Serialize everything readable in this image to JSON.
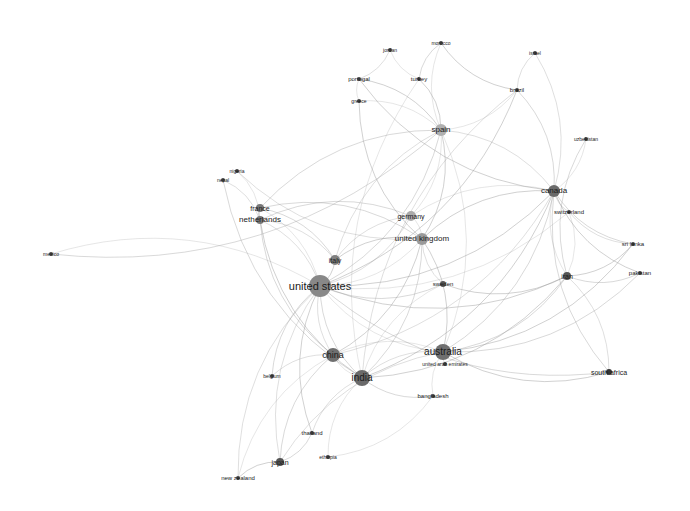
{
  "diagram": {
    "type": "network",
    "nodes": [
      {
        "id": "united states",
        "label": "united states",
        "x": 320,
        "y": 286,
        "r": 11,
        "fs": 11,
        "color": "#888888"
      },
      {
        "id": "australia",
        "label": "australia",
        "x": 443,
        "y": 352,
        "r": 8,
        "fs": 10,
        "color": "#6f6f6f"
      },
      {
        "id": "china",
        "label": "china",
        "x": 333,
        "y": 355,
        "r": 7,
        "fs": 9,
        "color": "#6f6f6f"
      },
      {
        "id": "india",
        "label": "india",
        "x": 362,
        "y": 378,
        "r": 8,
        "fs": 10,
        "color": "#6a6a6a"
      },
      {
        "id": "canada",
        "label": "canada",
        "x": 554,
        "y": 191,
        "r": 6,
        "fs": 8,
        "color": "#6a6a6a"
      },
      {
        "id": "united kingdom",
        "label": "united kingdom",
        "x": 422,
        "y": 239,
        "r": 6,
        "fs": 8,
        "color": "#9a9a9a"
      },
      {
        "id": "germany",
        "label": "germany",
        "x": 411,
        "y": 216,
        "r": 5,
        "fs": 7,
        "color": "#aaaaaa"
      },
      {
        "id": "spain",
        "label": "spain",
        "x": 441,
        "y": 130,
        "r": 6,
        "fs": 8,
        "color": "#b0b0b0"
      },
      {
        "id": "italy",
        "label": "italy",
        "x": 335,
        "y": 260,
        "r": 5,
        "fs": 7,
        "color": "#808080"
      },
      {
        "id": "france",
        "label": "france",
        "x": 260,
        "y": 208,
        "r": 4,
        "fs": 7,
        "color": "#777777"
      },
      {
        "id": "netherlands",
        "label": "netherlands",
        "x": 260,
        "y": 220,
        "r": 4,
        "fs": 8,
        "color": "#777777"
      },
      {
        "id": "sweden",
        "label": "sweden",
        "x": 443,
        "y": 284,
        "r": 3,
        "fs": 6,
        "color": "#555555"
      },
      {
        "id": "iran",
        "label": "iran",
        "x": 567,
        "y": 276,
        "r": 4,
        "fs": 7,
        "color": "#555555"
      },
      {
        "id": "switzerland",
        "label": "switzerland",
        "x": 569,
        "y": 212,
        "r": 2,
        "fs": 6,
        "color": "#444444"
      },
      {
        "id": "uzbekistan",
        "label": "uzbekistan",
        "x": 586,
        "y": 139,
        "r": 2,
        "fs": 5,
        "color": "#444444"
      },
      {
        "id": "sri lanka",
        "label": "sri lanka",
        "x": 633,
        "y": 244,
        "r": 2,
        "fs": 6,
        "color": "#444444"
      },
      {
        "id": "pakistan",
        "label": "pakistan",
        "x": 640,
        "y": 273,
        "r": 2,
        "fs": 6,
        "color": "#444444"
      },
      {
        "id": "south africa",
        "label": "south africa",
        "x": 609,
        "y": 372,
        "r": 3,
        "fs": 7,
        "color": "#333333"
      },
      {
        "id": "united arab emirates",
        "label": "united arab emirates",
        "x": 445,
        "y": 364,
        "r": 2,
        "fs": 5,
        "color": "#444444"
      },
      {
        "id": "bangladesh",
        "label": "bangladesh",
        "x": 433,
        "y": 396,
        "r": 2,
        "fs": 6,
        "color": "#444444"
      },
      {
        "id": "belgium",
        "label": "belgium",
        "x": 272,
        "y": 376,
        "r": 2,
        "fs": 5,
        "color": "#444444"
      },
      {
        "id": "thailand",
        "label": "thailand",
        "x": 312,
        "y": 433,
        "r": 2,
        "fs": 6,
        "color": "#444444"
      },
      {
        "id": "ethiopia",
        "label": "ethiopia",
        "x": 328,
        "y": 457,
        "r": 2,
        "fs": 5,
        "color": "#444444"
      },
      {
        "id": "japan",
        "label": "japan",
        "x": 280,
        "y": 462,
        "r": 4,
        "fs": 7,
        "color": "#555555"
      },
      {
        "id": "new zealand",
        "label": "new zealand",
        "x": 238,
        "y": 478,
        "r": 2,
        "fs": 6,
        "color": "#444444"
      },
      {
        "id": "mexico",
        "label": "mexico",
        "x": 51,
        "y": 254,
        "r": 2,
        "fs": 5,
        "color": "#444444"
      },
      {
        "id": "nigeria",
        "label": "nigeria",
        "x": 237,
        "y": 171,
        "r": 2,
        "fs": 5,
        "color": "#444444"
      },
      {
        "id": "nepal",
        "label": "nepal",
        "x": 223,
        "y": 180,
        "r": 2,
        "fs": 5,
        "color": "#444444"
      },
      {
        "id": "portugal",
        "label": "portugal",
        "x": 359,
        "y": 79,
        "r": 2,
        "fs": 6,
        "color": "#444444"
      },
      {
        "id": "greece",
        "label": "greece",
        "x": 359,
        "y": 101,
        "r": 2,
        "fs": 5,
        "color": "#444444"
      },
      {
        "id": "jordan",
        "label": "jordan",
        "x": 390,
        "y": 50,
        "r": 2,
        "fs": 5,
        "color": "#444444"
      },
      {
        "id": "morocco",
        "label": "morocco",
        "x": 441,
        "y": 43,
        "r": 2,
        "fs": 5,
        "color": "#444444"
      },
      {
        "id": "turkey",
        "label": "turkey",
        "x": 419,
        "y": 79,
        "r": 2,
        "fs": 6,
        "color": "#444444"
      },
      {
        "id": "israel",
        "label": "israel",
        "x": 535,
        "y": 53,
        "r": 2,
        "fs": 5,
        "color": "#444444"
      },
      {
        "id": "brazil",
        "label": "brazil",
        "x": 517,
        "y": 90,
        "r": 2,
        "fs": 6,
        "color": "#444444"
      }
    ],
    "edges": [
      [
        "united states",
        "australia"
      ],
      [
        "united states",
        "china"
      ],
      [
        "united states",
        "india"
      ],
      [
        "united states",
        "canada"
      ],
      [
        "united states",
        "united kingdom"
      ],
      [
        "united states",
        "germany"
      ],
      [
        "united states",
        "spain"
      ],
      [
        "united states",
        "italy"
      ],
      [
        "united states",
        "france"
      ],
      [
        "united states",
        "netherlands"
      ],
      [
        "united states",
        "sweden"
      ],
      [
        "united states",
        "iran"
      ],
      [
        "united states",
        "mexico"
      ],
      [
        "united states",
        "japan"
      ],
      [
        "united states",
        "south africa"
      ],
      [
        "united states",
        "brazil"
      ],
      [
        "united states",
        "switzerland"
      ],
      [
        "united states",
        "new zealand"
      ],
      [
        "united states",
        "belgium"
      ],
      [
        "united states",
        "thailand"
      ],
      [
        "australia",
        "china"
      ],
      [
        "australia",
        "india"
      ],
      [
        "australia",
        "canada"
      ],
      [
        "australia",
        "united kingdom"
      ],
      [
        "australia",
        "bangladesh"
      ],
      [
        "australia",
        "united arab emirates"
      ],
      [
        "australia",
        "iran"
      ],
      [
        "australia",
        "south africa"
      ],
      [
        "australia",
        "spain"
      ],
      [
        "australia",
        "japan"
      ],
      [
        "australia",
        "pakistan"
      ],
      [
        "australia",
        "sri lanka"
      ],
      [
        "china",
        "india"
      ],
      [
        "china",
        "canada"
      ],
      [
        "china",
        "japan"
      ],
      [
        "china",
        "united kingdom"
      ],
      [
        "china",
        "new zealand"
      ],
      [
        "china",
        "belgium"
      ],
      [
        "india",
        "bangladesh"
      ],
      [
        "india",
        "canada"
      ],
      [
        "india",
        "ethiopia"
      ],
      [
        "india",
        "thailand"
      ],
      [
        "india",
        "united kingdom"
      ],
      [
        "india",
        "iran"
      ],
      [
        "canada",
        "uzbekistan"
      ],
      [
        "canada",
        "switzerland"
      ],
      [
        "canada",
        "sri lanka"
      ],
      [
        "canada",
        "pakistan"
      ],
      [
        "canada",
        "iran"
      ],
      [
        "canada",
        "spain"
      ],
      [
        "canada",
        "brazil"
      ],
      [
        "canada",
        "united kingdom"
      ],
      [
        "canada",
        "germany"
      ],
      [
        "canada",
        "israel"
      ],
      [
        "canada",
        "south africa"
      ],
      [
        "united kingdom",
        "spain"
      ],
      [
        "united kingdom",
        "germany"
      ],
      [
        "united kingdom",
        "sweden"
      ],
      [
        "united kingdom",
        "france"
      ],
      [
        "united kingdom",
        "italy"
      ],
      [
        "germany",
        "spain"
      ],
      [
        "germany",
        "italy"
      ],
      [
        "germany",
        "netherlands"
      ],
      [
        "spain",
        "portugal"
      ],
      [
        "spain",
        "brazil"
      ],
      [
        "spain",
        "italy"
      ],
      [
        "spain",
        "france"
      ],
      [
        "spain",
        "turkey"
      ],
      [
        "spain",
        "greece"
      ],
      [
        "italy",
        "netherlands"
      ],
      [
        "italy",
        "france"
      ],
      [
        "france",
        "netherlands"
      ],
      [
        "netherlands",
        "nigeria"
      ],
      [
        "netherlands",
        "nepal"
      ],
      [
        "netherlands",
        "china"
      ],
      [
        "netherlands",
        "india"
      ],
      [
        "portugal",
        "greece"
      ],
      [
        "portugal",
        "jordan"
      ],
      [
        "morocco",
        "turkey"
      ],
      [
        "morocco",
        "brazil"
      ],
      [
        "jordan",
        "turkey"
      ],
      [
        "israel",
        "brazil"
      ],
      [
        "iran",
        "pakistan"
      ],
      [
        "iran",
        "sri lanka"
      ],
      [
        "iran",
        "switzerland"
      ],
      [
        "switzerland",
        "sri lanka"
      ],
      [
        "uzbekistan",
        "iran"
      ],
      [
        "sweden",
        "iran"
      ],
      [
        "sweden",
        "india"
      ],
      [
        "south africa",
        "iran"
      ],
      [
        "japan",
        "thailand"
      ],
      [
        "japan",
        "new zealand"
      ],
      [
        "ethiopia",
        "bangladesh"
      ],
      [
        "nigeria",
        "united kingdom"
      ],
      [
        "nepal",
        "india"
      ],
      [
        "greece",
        "united kingdom"
      ],
      [
        "turkey",
        "india"
      ],
      [
        "brazil",
        "india"
      ],
      [
        "mexico",
        "spain"
      ],
      [
        "portugal",
        "canada"
      ],
      [
        "morocco",
        "spain"
      ]
    ]
  }
}
